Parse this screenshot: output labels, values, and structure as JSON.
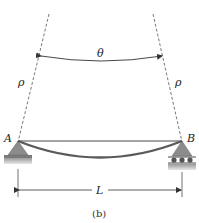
{
  "figure": {
    "caption": "(b)",
    "labels": {
      "angle": "θ",
      "radius_left": "ρ",
      "radius_right": "ρ",
      "support_left": "A",
      "support_right": "B",
      "length": "L"
    },
    "colors": {
      "beam": "#5a5a5a",
      "support_fill": "#8c8c8c",
      "ground": "#b5b5b5",
      "line": "#333333",
      "dashed": "#555555"
    },
    "supports": {
      "left": "pin",
      "right": "roller"
    }
  }
}
